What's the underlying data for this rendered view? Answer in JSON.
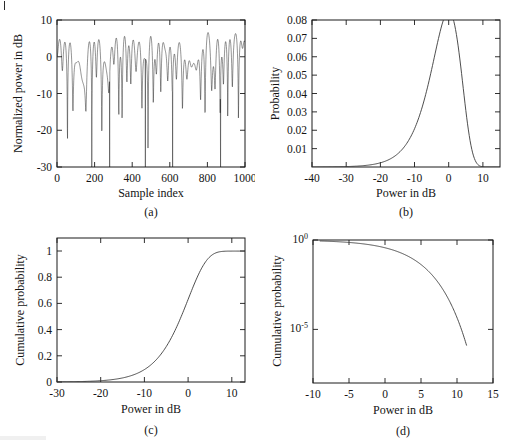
{
  "figure": {
    "background": "#ffffff",
    "line_color": "#3a3a3a",
    "axis_color": "#1a1a1a",
    "panels": [
      "a",
      "b",
      "c",
      "d"
    ]
  },
  "panel_a": {
    "caption": "(a)",
    "xlabel": "Sample index",
    "ylabel": "Normalized power in dB",
    "xticks": [
      "0",
      "200",
      "400",
      "600",
      "800",
      "1000"
    ],
    "yticks": [
      "-30",
      "-20",
      "-10",
      "0",
      "10"
    ]
  },
  "panel_b": {
    "caption": "(b)",
    "xlabel": "Power in dB",
    "ylabel": "Probability",
    "xticks": [
      "-40",
      "-30",
      "-20",
      "-10",
      "0",
      "10"
    ],
    "yticks": [
      "0.01",
      "0.02",
      "0.03",
      "0.04",
      "0.05",
      "0.06",
      "0.07",
      "0.08"
    ]
  },
  "panel_c": {
    "caption": "(c)",
    "xlabel": "Power in dB",
    "ylabel": "Cumulative probability",
    "xticks": [
      "-30",
      "-20",
      "-10",
      "0",
      "10"
    ],
    "yticks": [
      "0",
      "0.2",
      "0.4",
      "0.6",
      "0.8",
      "1"
    ]
  },
  "panel_d": {
    "caption": "(d)",
    "xlabel": "Power in dB",
    "ylabel": "Cumulative probability",
    "xticks": [
      "-10",
      "-5",
      "0",
      "5",
      "10",
      "15"
    ],
    "yticks": [
      {
        "mantissa": "10",
        "exponent": "0"
      },
      {
        "mantissa": "10",
        "exponent": "-5"
      }
    ]
  },
  "chart_data": [
    {
      "type": "line",
      "panel": "a",
      "title": "",
      "xlabel": "Sample index",
      "ylabel": "Normalized power in dB",
      "xlim": [
        0,
        1000
      ],
      "ylim": [
        -30,
        10
      ],
      "xticks": [
        0,
        200,
        400,
        600,
        800,
        1000
      ],
      "yticks": [
        -30,
        -20,
        -10,
        0,
        10
      ],
      "grid": false,
      "legend": "none",
      "description": "Rayleigh fading envelope: normalized received power versus sample index. Rapidly varying signal, mean level near -2 dB, peaks reaching about +8 dB, deep fades down to -30 dB.",
      "series": [
        {
          "name": "Normalized power",
          "mean_db": -2.0,
          "peak_db": 8.0,
          "min_db": -30.0,
          "samples": 1000,
          "distribution": "exponential power (Rayleigh amplitude)"
        }
      ],
      "deep_fade_sample_indices": [
        185,
        280,
        470,
        615,
        870
      ]
    },
    {
      "type": "line",
      "panel": "b",
      "title": "",
      "xlabel": "Power in dB",
      "ylabel": "Probability",
      "xlim": [
        -40,
        15
      ],
      "ylim": [
        0,
        0.08
      ],
      "xticks": [
        -40,
        -30,
        -20,
        -10,
        0,
        10
      ],
      "yticks": [
        0.01,
        0.02,
        0.03,
        0.04,
        0.05,
        0.06,
        0.07,
        0.08
      ],
      "grid": false,
      "legend": "none",
      "description": "Probability density function of received power expressed in dB for Rayleigh fading. Left-skewed with a long low-power tail.",
      "x": [
        -40,
        -35,
        -30,
        -27,
        -24,
        -21,
        -18,
        -16,
        -14,
        -12,
        -10,
        -8,
        -6,
        -4,
        -2,
        -1,
        0,
        1,
        2,
        3,
        4,
        5,
        6,
        7,
        8,
        9,
        10,
        11,
        12
      ],
      "values": [
        0.0,
        0.0001,
        0.0003,
        0.0006,
        0.0012,
        0.0024,
        0.0047,
        0.0072,
        0.0109,
        0.0164,
        0.0241,
        0.0342,
        0.0462,
        0.0586,
        0.0688,
        0.0715,
        0.072,
        0.0708,
        0.0672,
        0.0612,
        0.053,
        0.0432,
        0.0329,
        0.0228,
        0.014,
        0.0075,
        0.0034,
        0.0012,
        0.0003
      ],
      "peak": {
        "x": 0.0,
        "y": 0.072
      }
    },
    {
      "type": "line",
      "panel": "c",
      "title": "",
      "xlabel": "Power in dB",
      "ylabel": "Cumulative probability",
      "xlim": [
        -30,
        13
      ],
      "ylim": [
        0,
        1.1
      ],
      "xticks": [
        -30,
        -20,
        -10,
        0,
        10
      ],
      "yticks": [
        0,
        0.2,
        0.4,
        0.6,
        0.8,
        1
      ],
      "grid": false,
      "legend": "none",
      "description": "Cumulative distribution function of Rayleigh-faded power on a linear probability scale, rising from 0 to 1 with a sigmoid shape.",
      "x": [
        -30,
        -25,
        -20,
        -18,
        -16,
        -14,
        -12,
        -10,
        -8,
        -6,
        -4,
        -2,
        0,
        2,
        4,
        6,
        8,
        10,
        12,
        13
      ],
      "values": [
        0.001,
        0.003,
        0.01,
        0.016,
        0.025,
        0.039,
        0.06,
        0.095,
        0.145,
        0.221,
        0.329,
        0.47,
        0.632,
        0.794,
        0.918,
        0.98,
        0.997,
        0.9999,
        1.0,
        1.0
      ]
    },
    {
      "type": "line",
      "panel": "d",
      "title": "",
      "xlabel": "Power in dB",
      "ylabel": "Cumulative probability",
      "xlim": [
        -10,
        15
      ],
      "ylim_log": [
        1e-08,
        1
      ],
      "yscale": "log",
      "xticks": [
        -10,
        -5,
        0,
        5,
        10,
        15
      ],
      "yticks_log": [
        1,
        1e-05
      ],
      "grid": false,
      "legend": "none",
      "description": "Complementary view of the cumulative distribution plotted on a logarithmic probability axis, showing the rapid roll-off of the upper tail beyond 5 dB.",
      "x": [
        -9.0,
        -8,
        -7,
        -6,
        -5,
        -4,
        -3,
        -2,
        -1,
        0,
        1,
        2,
        3,
        4,
        5,
        6,
        7,
        8,
        9,
        10,
        11,
        11.3
      ],
      "values": [
        0.89,
        0.85,
        0.82,
        0.77,
        0.72,
        0.66,
        0.59,
        0.51,
        0.43,
        0.35,
        0.27,
        0.2,
        0.14,
        0.092,
        0.055,
        0.03,
        0.014,
        0.0053,
        0.0015,
        0.00025,
        1.7e-06,
        5e-07
      ]
    }
  ]
}
